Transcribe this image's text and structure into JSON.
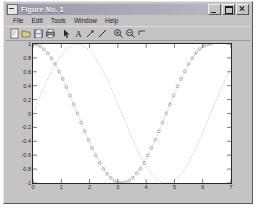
{
  "window": {
    "title": "Figure No. 1",
    "sysicon": "matlab-figure-icon",
    "buttons": [
      {
        "name": "minimize-button",
        "label": "_"
      },
      {
        "name": "maximize-button",
        "label": "□"
      },
      {
        "name": "close-button",
        "label": "×"
      }
    ]
  },
  "menubar": {
    "items": [
      "File",
      "Edit",
      "Tools",
      "Window",
      "Help"
    ]
  },
  "toolbar": {
    "items": [
      {
        "name": "new-figure-icon",
        "label": "New Figure"
      },
      {
        "name": "open-file-icon",
        "label": "Open"
      },
      {
        "name": "save-figure-icon",
        "label": "Save"
      },
      {
        "name": "print-figure-icon",
        "label": "Print"
      },
      {
        "name": "pointer-select-icon",
        "label": "Select"
      },
      {
        "name": "insert-text-icon",
        "label": "Insert Text"
      },
      {
        "name": "insert-arrow-icon",
        "label": "Insert Arrow"
      },
      {
        "name": "insert-line-icon",
        "label": "Insert Line"
      },
      {
        "name": "zoom-in-icon",
        "label": "Zoom In"
      },
      {
        "name": "zoom-out-icon",
        "label": "Zoom Out"
      },
      {
        "name": "rotate-3d-icon",
        "label": "Rotate 3D"
      }
    ]
  },
  "chart_data": {
    "type": "line",
    "title": "",
    "xlabel": "",
    "ylabel": "",
    "xlim": [
      0,
      7
    ],
    "ylim": [
      -1,
      1
    ],
    "grid": false,
    "legend": "none",
    "xticks": [
      "0",
      "1",
      "2",
      "3",
      "4",
      "5",
      "6",
      "7"
    ],
    "xtick_values": [
      0,
      1,
      2,
      3,
      4,
      5,
      6,
      7
    ],
    "yticks": [
      "1",
      "0.8",
      "0.6",
      "0.4",
      "0.2",
      "0",
      "-0.2",
      "-0.4",
      "-0.6",
      "-0.8",
      "-1"
    ],
    "ytick_values": [
      1,
      0.8,
      0.6,
      0.4,
      0.2,
      0,
      -0.2,
      -0.4,
      -0.6,
      -0.8,
      -1
    ],
    "series": [
      {
        "name": "cos(x)",
        "style": "circle-markers",
        "color": "#8c8c8c",
        "x": [
          0,
          0.13,
          0.26,
          0.39,
          0.52,
          0.65,
          0.78,
          0.92,
          1.05,
          1.18,
          1.31,
          1.44,
          1.57,
          1.7,
          1.83,
          1.96,
          2.09,
          2.22,
          2.36,
          2.49,
          2.62,
          2.75,
          2.88,
          3.01,
          3.14,
          3.27,
          3.4,
          3.53,
          3.67,
          3.8,
          3.93,
          4.06,
          4.19,
          4.32,
          4.45,
          4.58,
          4.71,
          4.84,
          4.97,
          5.11,
          5.24,
          5.37,
          5.5,
          5.63,
          5.76,
          5.89,
          6.02,
          6.15,
          6.28
        ],
        "y": [
          1.0,
          0.991,
          0.966,
          0.924,
          0.867,
          0.796,
          0.711,
          0.605,
          0.497,
          0.38,
          0.258,
          0.131,
          0.001,
          -0.129,
          -0.257,
          -0.379,
          -0.496,
          -0.604,
          -0.712,
          -0.797,
          -0.868,
          -0.925,
          -0.967,
          -0.992,
          -1.0,
          -0.991,
          -0.966,
          -0.923,
          -0.86,
          -0.795,
          -0.71,
          -0.603,
          -0.495,
          -0.378,
          -0.256,
          -0.128,
          0.002,
          0.131,
          0.259,
          0.392,
          0.499,
          0.606,
          0.713,
          0.798,
          0.869,
          0.926,
          0.967,
          0.992,
          1.0
        ]
      },
      {
        "name": "sin(x)",
        "style": "dotted",
        "color": "#a8a8a8",
        "x": [
          0,
          0.13,
          0.26,
          0.39,
          0.52,
          0.65,
          0.78,
          0.92,
          1.05,
          1.18,
          1.31,
          1.44,
          1.57,
          1.7,
          1.83,
          1.96,
          2.09,
          2.22,
          2.36,
          2.49,
          2.62,
          2.75,
          2.88,
          3.01,
          3.14,
          3.27,
          3.4,
          3.53,
          3.67,
          3.8,
          3.93,
          4.06,
          4.19,
          4.32,
          4.45,
          4.58,
          4.71,
          4.84,
          4.97,
          5.11,
          5.24,
          5.37,
          5.5,
          5.63,
          5.76,
          5.89,
          6.02,
          6.15,
          6.28,
          6.41,
          6.54,
          6.67,
          6.8,
          6.93,
          7.0
        ],
        "y": [
          0.0,
          0.13,
          0.257,
          0.38,
          0.497,
          0.605,
          0.703,
          0.796,
          0.868,
          0.925,
          0.966,
          0.991,
          1.0,
          0.992,
          0.966,
          0.925,
          0.868,
          0.797,
          0.702,
          0.605,
          0.497,
          0.381,
          0.258,
          0.131,
          0.002,
          -0.129,
          -0.256,
          -0.378,
          -0.502,
          -0.612,
          -0.711,
          -0.797,
          -0.868,
          -0.925,
          -0.967,
          -0.992,
          -1.0,
          -0.992,
          -0.966,
          -0.923,
          -0.867,
          -0.796,
          -0.706,
          -0.604,
          -0.496,
          -0.379,
          -0.257,
          -0.13,
          -0.001,
          0.129,
          0.255,
          0.377,
          0.494,
          0.603,
          0.657
        ]
      }
    ]
  }
}
